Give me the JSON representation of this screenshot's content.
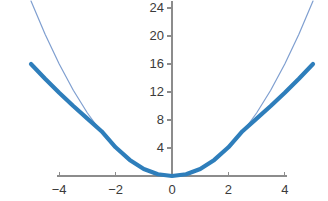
{
  "chart_data": {
    "type": "line",
    "title": "",
    "subtitle": "",
    "xlabel": "",
    "ylabel": "",
    "xlim": [
      -5.2,
      5.2
    ],
    "ylim": [
      -1.0,
      26.5
    ],
    "grid": false,
    "legend": "none",
    "background": "#ffffff",
    "axis_color": "#8c8c8c",
    "tick_label_color": "#3b3b3b",
    "x_ticks": [
      -4,
      -2,
      0,
      2,
      4
    ],
    "x_tick_labels": [
      "−4",
      "−2",
      "0",
      "2",
      "4"
    ],
    "y_ticks": [
      4,
      8,
      12,
      16,
      20,
      24
    ],
    "y_tick_labels": [
      "4",
      "8",
      "12",
      "16",
      "20",
      "24"
    ],
    "x": [
      -5,
      -4.5,
      -4,
      -3.5,
      -3,
      -2.5,
      -2,
      -1.5,
      -1,
      -0.5,
      0,
      0.5,
      1,
      1.5,
      2,
      2.5,
      3,
      3.5,
      4,
      4.5,
      5
    ],
    "series": [
      {
        "name": "thin-parabola",
        "style": "thin",
        "color": "#7f9fd0",
        "width": 1.2,
        "values": [
          25,
          20.25,
          16,
          12.25,
          9,
          6.25,
          4,
          2.25,
          1,
          0.25,
          0,
          0.25,
          1,
          2.25,
          4,
          6.25,
          9,
          12.25,
          16,
          20.25,
          25
        ]
      },
      {
        "name": "thick-curve",
        "style": "thick",
        "color": "#2e7ebb",
        "width": 4.2,
        "values": [
          16,
          13.9,
          11.9,
          10.0,
          8.2,
          6.4,
          4.1,
          2.3,
          1.0,
          0.25,
          0,
          0.25,
          1.0,
          2.3,
          4.1,
          6.4,
          8.2,
          10.0,
          11.9,
          13.9,
          16
        ]
      }
    ]
  },
  "axes": {
    "x_axis_name": "x-axis",
    "y_axis_name": "y-axis"
  }
}
